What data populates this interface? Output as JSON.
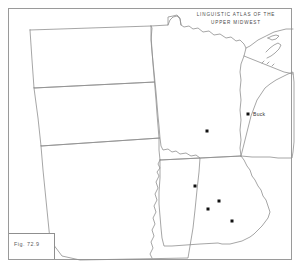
{
  "figure": {
    "title_line1": "LINGUISTIC ATLAS OF THE",
    "title_line2": "UPPER MIDWEST",
    "figure_number": "Fig. 72.9",
    "width": 302,
    "height": 270,
    "background_color": "#ffffff",
    "border_color": "#9a9a9a",
    "outline_color": "#8f8f8f",
    "dot_color": "#111111"
  },
  "chart_data": {
    "type": "scatter",
    "title": "LINGUISTIC ATLAS OF THE UPPER MIDWEST",
    "xlabel": "",
    "ylabel": "",
    "grid": false,
    "legend": "none",
    "xlim": [
      0,
      302
    ],
    "ylim": [
      0,
      270
    ],
    "regions": [
      {
        "name": "North Dakota"
      },
      {
        "name": "South Dakota"
      },
      {
        "name": "Nebraska"
      },
      {
        "name": "Minnesota"
      },
      {
        "name": "Iowa"
      },
      {
        "name": "Wisconsin"
      },
      {
        "name": "Lake Superior"
      }
    ],
    "points": [
      {
        "label": "",
        "state": "Minnesota",
        "x": 207,
        "y": 131
      },
      {
        "label": "Buck",
        "state": "Wisconsin",
        "x": 248,
        "y": 114
      },
      {
        "label": "",
        "state": "Iowa",
        "x": 195,
        "y": 186
      },
      {
        "label": "",
        "state": "Iowa",
        "x": 219,
        "y": 201
      },
      {
        "label": "",
        "state": "Iowa",
        "x": 208,
        "y": 209
      },
      {
        "label": "",
        "state": "Iowa",
        "x": 232,
        "y": 221
      }
    ],
    "point_count": 6,
    "labeled_points": [
      "Buck"
    ]
  }
}
